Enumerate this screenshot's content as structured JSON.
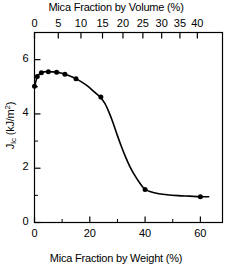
{
  "chart_data": {
    "type": "line",
    "title": "",
    "xlabel": "Mica Fraction by Weight (%)",
    "ylabel": "JIc (kJ/m2)",
    "top_axis_label": "Mica Fraction by Volume (%)",
    "xlim": [
      0,
      68
    ],
    "ylim": [
      0,
      7
    ],
    "grid": false,
    "legend": null,
    "marker": "filled-circle",
    "line_color": "#000000",
    "bottom_ticks": [
      0,
      20,
      40,
      60
    ],
    "bottom_minor_ticks": [
      10,
      30,
      50
    ],
    "top_ticks": [
      {
        "label": "0",
        "weight_pos": 0.0
      },
      {
        "label": "5",
        "weight_pos": 8.6
      },
      {
        "label": "10",
        "weight_pos": 16.8
      },
      {
        "label": "15",
        "weight_pos": 24.6
      },
      {
        "label": "20",
        "weight_pos": 32.0
      },
      {
        "label": "25",
        "weight_pos": 39.2
      },
      {
        "label": "30",
        "weight_pos": 46.0
      },
      {
        "label": "35",
        "weight_pos": 52.6
      },
      {
        "label": "40",
        "weight_pos": 58.9
      }
    ],
    "y_ticks": [
      0,
      2,
      4,
      6
    ],
    "y_minor_ticks": [
      1,
      3,
      5,
      7
    ],
    "x": [
      0.0,
      1.0,
      2.5,
      5.0,
      8.0,
      11.0,
      15.0,
      24.0,
      40.0,
      60.0
    ],
    "values": [
      5.02,
      5.38,
      5.52,
      5.55,
      5.54,
      5.46,
      5.3,
      4.62,
      1.22,
      0.95
    ],
    "series": [
      {
        "name": "JIc",
        "x": [
          0.0,
          1.0,
          2.5,
          5.0,
          8.0,
          11.0,
          15.0,
          24.0,
          40.0,
          60.0
        ],
        "values": [
          5.02,
          5.38,
          5.52,
          5.55,
          5.54,
          5.46,
          5.3,
          4.62,
          1.22,
          0.95
        ]
      }
    ],
    "curve_points": [
      [
        0.0,
        5.02
      ],
      [
        0.6,
        5.24
      ],
      [
        1.0,
        5.38
      ],
      [
        1.8,
        5.48
      ],
      [
        2.5,
        5.52
      ],
      [
        3.5,
        5.55
      ],
      [
        5.0,
        5.55
      ],
      [
        6.5,
        5.55
      ],
      [
        8.0,
        5.54
      ],
      [
        9.5,
        5.51
      ],
      [
        11.0,
        5.46
      ],
      [
        13.0,
        5.39
      ],
      [
        15.0,
        5.3
      ],
      [
        17.0,
        5.18
      ],
      [
        19.0,
        5.04
      ],
      [
        21.0,
        4.87
      ],
      [
        23.0,
        4.69
      ],
      [
        24.0,
        4.6
      ],
      [
        25.5,
        4.38
      ],
      [
        27.0,
        4.05
      ],
      [
        28.5,
        3.65
      ],
      [
        30.0,
        3.2
      ],
      [
        31.5,
        2.78
      ],
      [
        33.0,
        2.4
      ],
      [
        34.5,
        2.06
      ],
      [
        36.0,
        1.78
      ],
      [
        37.5,
        1.54
      ],
      [
        39.0,
        1.33
      ],
      [
        40.0,
        1.22
      ],
      [
        42.0,
        1.13
      ],
      [
        45.0,
        1.06
      ],
      [
        48.0,
        1.02
      ],
      [
        52.0,
        0.99
      ],
      [
        56.0,
        0.97
      ],
      [
        60.0,
        0.95
      ],
      [
        63.0,
        0.95
      ]
    ]
  },
  "axes": {
    "top_title": "Mica Fraction by Volume (%)",
    "bottom_title": "Mica Fraction by Weight (%)",
    "y_title_main": "J",
    "y_title_sub": "Ic",
    "y_title_unit": " (kJ/m",
    "y_title_sup": "2",
    "y_title_close": ")"
  },
  "tick_labels": {
    "bottom": [
      "0",
      "20",
      "40",
      "60"
    ],
    "top": [
      "0",
      "5",
      "10",
      "15",
      "20",
      "25",
      "30",
      "35",
      "40"
    ],
    "left": [
      "0",
      "2",
      "4",
      "6"
    ]
  },
  "style": {
    "axis_color": "#000000",
    "background": "#ffffff",
    "marker_color": "#000000"
  }
}
